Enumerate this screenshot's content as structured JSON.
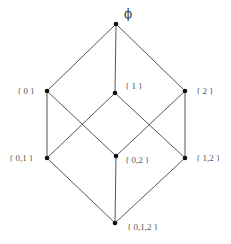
{
  "diagram": {
    "nodes": [
      {
        "id": "empty",
        "label": "ϕ",
        "x": 116,
        "y": 24,
        "label_x": 124,
        "label_y": 18
      },
      {
        "id": "s0",
        "label": "{ 0 }",
        "x": 47,
        "y": 91,
        "label_x": 17,
        "label_y": 94
      },
      {
        "id": "s1",
        "label": "{ 1 }",
        "x": 115,
        "y": 93,
        "label_x": 125,
        "label_y": 89
      },
      {
        "id": "s2",
        "label": "{ 2 }",
        "x": 185,
        "y": 91,
        "label_x": 196,
        "label_y": 94
      },
      {
        "id": "s01",
        "label": "{ 0,1 }",
        "x": 47,
        "y": 158,
        "label_x": 9,
        "label_y": 161
      },
      {
        "id": "s02",
        "label": "{ 0,2 }",
        "x": 116,
        "y": 156,
        "label_x": 125,
        "label_y": 163
      },
      {
        "id": "s12",
        "label": "{ 1,2 }",
        "x": 185,
        "y": 158,
        "label_x": 196,
        "label_y": 161
      },
      {
        "id": "s012",
        "label": "{ 0,1,2 }",
        "x": 115,
        "y": 223,
        "label_x": 127,
        "label_y": 230
      }
    ],
    "edges": [
      [
        "empty",
        "s0"
      ],
      [
        "empty",
        "s1"
      ],
      [
        "empty",
        "s2"
      ],
      [
        "s0",
        "s01"
      ],
      [
        "s0",
        "s02"
      ],
      [
        "s1",
        "s01"
      ],
      [
        "s1",
        "s12"
      ],
      [
        "s2",
        "s02"
      ],
      [
        "s2",
        "s12"
      ],
      [
        "s01",
        "s012"
      ],
      [
        "s02",
        "s012"
      ],
      [
        "s12",
        "s012"
      ]
    ],
    "colors": {
      "edge": "#444444",
      "node": "#111111",
      "label": "#555555"
    }
  }
}
